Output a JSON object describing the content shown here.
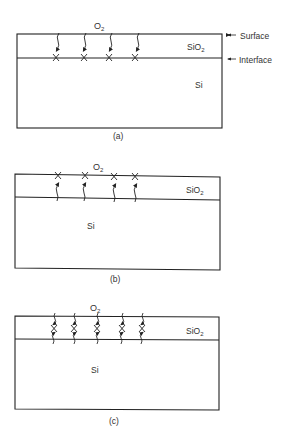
{
  "panels": [
    {
      "id": "a",
      "caption": "(a)",
      "gas": "O",
      "gas_sub": "2",
      "oxide": "SiO",
      "oxide_sub": "2",
      "substrate": "Si",
      "annotations": {
        "surface": "Surface",
        "interface": "Interface"
      },
      "description": "Oxygen diffuses through SiO2; reaction at Si/SiO2 interface"
    },
    {
      "id": "b",
      "caption": "(b)",
      "gas": "O",
      "gas_sub": "2",
      "oxide": "SiO",
      "oxide_sub": "2",
      "substrate": "Si",
      "description": "Silicon diffuses outward; reaction at oxide surface"
    },
    {
      "id": "c",
      "caption": "(c)",
      "gas": "O",
      "gas_sub": "2",
      "oxide": "SiO",
      "oxide_sub": "2",
      "substrate": "Si",
      "description": "Both species diffuse; reaction within oxide"
    }
  ],
  "colors": {
    "line": "#222222",
    "text": "#333333",
    "background": "#ffffff"
  }
}
